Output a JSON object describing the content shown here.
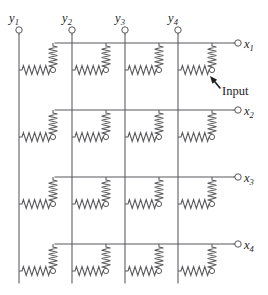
{
  "figure": {
    "name": "resistor-crossbar-array",
    "width": 268,
    "height": 295,
    "background_color": "#ffffff",
    "wire_color": "#59595c",
    "text_color": "#1d1d1f"
  },
  "columns": [
    {
      "id": "y1",
      "label": "y",
      "subscript": "1",
      "x": 19,
      "terminal_y": 30
    },
    {
      "id": "y2",
      "label": "y",
      "subscript": "2",
      "x": 72,
      "terminal_y": 30
    },
    {
      "id": "y3",
      "label": "y",
      "subscript": "3",
      "x": 125,
      "terminal_y": 30
    },
    {
      "id": "y4",
      "label": "y",
      "subscript": "4",
      "x": 178,
      "terminal_y": 30
    }
  ],
  "rows": [
    {
      "id": "x1",
      "label": "x",
      "subscript": "1",
      "y": 43,
      "terminal_x": 238
    },
    {
      "id": "x2",
      "label": "x",
      "subscript": "2",
      "y": 110,
      "terminal_x": 238
    },
    {
      "id": "x3",
      "label": "x",
      "subscript": "3",
      "y": 177,
      "terminal_x": 238
    },
    {
      "id": "x4",
      "label": "x",
      "subscript": "4",
      "y": 244,
      "terminal_x": 238
    }
  ],
  "annotation": {
    "input_label": "Input",
    "input_label_x": 222,
    "input_label_y": 95,
    "arrow_tip_x": 210,
    "arrow_tip_y": 76,
    "arrow_tail_x": 220,
    "arrow_tail_y": 88,
    "points_to": "row-1-column-4-junction-node"
  },
  "geometry": {
    "column_line_top": 34,
    "column_line_bottom": 283,
    "row_line_left_offset": 36,
    "row_line_right": 234,
    "cell_junction_dx": 34,
    "cell_junction_dy": 27,
    "h_resistor_zigzags": 5,
    "v_resistor_zigzags": 5,
    "terminal_radius": 3.2,
    "node_radius": 2.6
  },
  "cells": [
    {
      "row": "x1",
      "col": "y1",
      "name": "cell-r1-c1"
    },
    {
      "row": "x1",
      "col": "y2",
      "name": "cell-r1-c2"
    },
    {
      "row": "x1",
      "col": "y3",
      "name": "cell-r1-c3"
    },
    {
      "row": "x1",
      "col": "y4",
      "name": "cell-r1-c4"
    },
    {
      "row": "x2",
      "col": "y1",
      "name": "cell-r2-c1"
    },
    {
      "row": "x2",
      "col": "y2",
      "name": "cell-r2-c2"
    },
    {
      "row": "x2",
      "col": "y3",
      "name": "cell-r2-c3"
    },
    {
      "row": "x2",
      "col": "y4",
      "name": "cell-r2-c4"
    },
    {
      "row": "x3",
      "col": "y1",
      "name": "cell-r3-c1"
    },
    {
      "row": "x3",
      "col": "y2",
      "name": "cell-r3-c2"
    },
    {
      "row": "x3",
      "col": "y3",
      "name": "cell-r3-c3"
    },
    {
      "row": "x3",
      "col": "y4",
      "name": "cell-r3-c4"
    },
    {
      "row": "x4",
      "col": "y1",
      "name": "cell-r4-c1"
    },
    {
      "row": "x4",
      "col": "y2",
      "name": "cell-r4-c2"
    },
    {
      "row": "x4",
      "col": "y3",
      "name": "cell-r4-c3"
    },
    {
      "row": "x4",
      "col": "y4",
      "name": "cell-r4-c4"
    }
  ]
}
